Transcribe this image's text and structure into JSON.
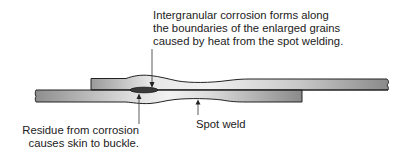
{
  "diagram": {
    "annotations": {
      "top": {
        "lines": [
          "Intergranular corrosion forms along",
          "the boundaries of the enlarged grains",
          "caused by heat from the spot welding."
        ]
      },
      "bottom_left": {
        "lines": [
          "Residue from corrosion",
          "causes skin to buckle."
        ]
      },
      "spot_weld": {
        "text": "Spot weld"
      }
    },
    "colors": {
      "plate_fill_light": "#e6e6e6",
      "plate_fill_dark": "#8f8f8f",
      "outline": "#222222",
      "residue": "#3a3a3a"
    }
  }
}
